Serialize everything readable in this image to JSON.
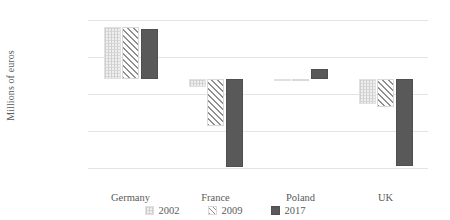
{
  "chart_data": {
    "type": "bar",
    "title": "",
    "xlabel": "",
    "ylabel": "Millions of euros",
    "categories": [
      "Germany",
      "France",
      "Poland",
      "UK"
    ],
    "series": [
      {
        "name": "2002",
        "values": [
          70000,
          -10000,
          -1000,
          -33000
        ]
      },
      {
        "name": "2009",
        "values": [
          70000,
          -63000,
          -500,
          -38000
        ]
      },
      {
        "name": "2017",
        "values": [
          68000,
          -118000,
          14000,
          -117000
        ]
      }
    ],
    "ylim": [
      -120000,
      80000
    ],
    "yticks": [
      80000,
      30000,
      -20000,
      -70000,
      -120000
    ],
    "ytick_labels": [
      "80,000",
      "30,000",
      "-20,000",
      "-70,000",
      "-120,000"
    ],
    "grid": true,
    "legend_position": "bottom",
    "colors": {
      "series_2002": "#efefef",
      "series_2009": "#fdfdfd",
      "series_2017": "#595959",
      "gridline": "#e4e4e4",
      "text": "#5a5a5a",
      "background": "#ffffff"
    }
  },
  "legend": {
    "items": [
      {
        "label": "2002",
        "key": "y2002"
      },
      {
        "label": "2009",
        "key": "y2009"
      },
      {
        "label": "2017",
        "key": "y2017"
      }
    ]
  }
}
